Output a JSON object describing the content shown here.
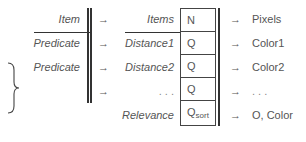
{
  "left_column": {
    "rows": [
      {
        "label": "Item"
      },
      {
        "label": "Predicate"
      },
      {
        "label": "Predicate"
      },
      {
        "label": ""
      }
    ]
  },
  "middle_column": {
    "rows": [
      {
        "label": "Items"
      },
      {
        "label": "Distance1"
      },
      {
        "label": "Distance2"
      },
      {
        "label": ". . ."
      },
      {
        "label": "Relevance"
      }
    ]
  },
  "box_column": {
    "cells": [
      {
        "value": "N",
        "sub": ""
      },
      {
        "value": "Q",
        "sub": ""
      },
      {
        "value": "Q",
        "sub": ""
      },
      {
        "value": "Q",
        "sub": ""
      },
      {
        "value": "Q",
        "sub": "sort"
      }
    ]
  },
  "right_column": {
    "rows": [
      {
        "label": "Pixels"
      },
      {
        "label": "Color1"
      },
      {
        "label": "Color2"
      },
      {
        "label": ". . ."
      },
      {
        "label": "O, Color"
      }
    ]
  },
  "arrow_glyph": "→",
  "colors": {
    "line": "#333333",
    "text": "#555555"
  }
}
